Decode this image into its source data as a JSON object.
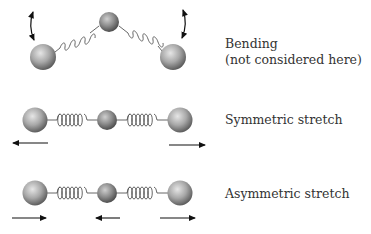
{
  "diagram": {
    "colors": {
      "atom_light": "#d8d8d8",
      "atom_dark": "#6a6a6a",
      "spring": "#555555",
      "arrow": "#111111",
      "text": "#333333"
    },
    "modes": [
      {
        "id": "bending",
        "label_line1": "Bending",
        "label_line2": "(not considered here)",
        "arrows": [
          "curved-double-left",
          "curved-double-right"
        ]
      },
      {
        "id": "symmetric-stretch",
        "label_line1": "Symmetric stretch",
        "arrows": [
          "left",
          "right"
        ]
      },
      {
        "id": "asymmetric-stretch",
        "label_line1": "Asymmetric stretch",
        "arrows": [
          "right",
          "left",
          "right"
        ]
      }
    ]
  }
}
